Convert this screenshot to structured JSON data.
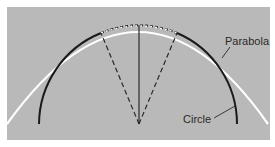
{
  "figure": {
    "background_color": "#b9b9b9",
    "labels": {
      "parabola": "Parabola",
      "circle": "Circle"
    },
    "colors": {
      "circle": "#1a1a1a",
      "parabola": "#ffffff",
      "radii": "#2a2a2a"
    }
  }
}
